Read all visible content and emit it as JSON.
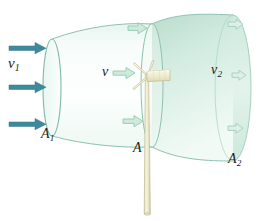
{
  "figure": {
    "type": "physics-diagram"
  },
  "labels": {
    "v1": {
      "symbol": "v",
      "subscript": "1",
      "name": "upstream-wind-speed"
    },
    "a1": {
      "symbol": "A",
      "subscript": "1",
      "name": "upstream-area"
    },
    "v": {
      "symbol": "v",
      "subscript": "",
      "name": "turbine-disk-wind-speed"
    },
    "a": {
      "symbol": "A",
      "subscript": "",
      "name": "turbine-disk-area"
    },
    "v2": {
      "symbol": "v",
      "subscript": "2",
      "name": "downstream-wind-speed"
    },
    "a2": {
      "symbol": "A",
      "subscript": "2",
      "name": "downstream-area"
    }
  },
  "arrows": {
    "inlet": {
      "count": 3,
      "color": "#3e8a9c",
      "direction": "right",
      "style": "solid-filled"
    },
    "disk": {
      "count": 3,
      "color": "#bfe3d2",
      "outline": "#8cc5ae",
      "direction": "right",
      "style": "outlined-pale"
    },
    "outlet": {
      "count": 3,
      "color": "#d4ece0",
      "outline": "#9ccdb5",
      "direction": "right",
      "style": "outlined-pale-small"
    }
  },
  "tube": {
    "fill_light": "#f4fbf8",
    "fill_mid": "#ddf0e7",
    "fill_dark": "#b9ddcd",
    "edge": "#8fc3ae",
    "opacity": "translucent"
  },
  "turbine": {
    "nacelle_color": "#f2efd4",
    "nacelle_edge": "#c9c49a",
    "tower_color": "#efecd2",
    "tower_edge": "#c8c39a",
    "blade_count": 3,
    "blade_color": "#f7f5e4"
  },
  "colors": {
    "background": "#ffffff",
    "text": "#1c1c1c",
    "accent_teal": "#3e8a9c",
    "accent_green": "#8fc3ae"
  }
}
